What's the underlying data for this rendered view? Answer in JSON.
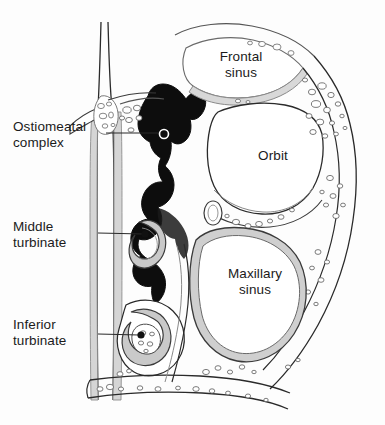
{
  "figure": {
    "background_color": "#fdfdfd",
    "width": 385,
    "height": 425
  },
  "palette": {
    "airspace_black": "#0d0d0d",
    "mucosa_gray": "#a8a8a8",
    "bone_gray": "#c9c9c9",
    "outline_dark": "#2a2a2a",
    "outline_light": "#555555",
    "marrow_fill": "#ffffff",
    "text_color": "#1b1b1b",
    "leader_color": "#2a2a2a"
  },
  "labels": {
    "ostiomeatal_complex": "Ostiomeatal\ncomplex",
    "middle_turbinate": "Middle\nturbinate",
    "inferior_turbinate": "Inferior\nturbinate",
    "frontal_sinus": "Frontal\nsinus",
    "orbit": "Orbit",
    "maxillary_sinus": "Maxillary\nsinus"
  },
  "leaders": [
    {
      "name": "ostiomeatal-complex",
      "from_x": 106,
      "from_y": 133,
      "to_x": 163,
      "to_y": 133,
      "marker": "open-circle",
      "marker_x": 164,
      "marker_y": 134,
      "marker_r": 4.5
    },
    {
      "name": "middle-turbinate",
      "from_x": 98,
      "from_y": 233,
      "to_x": 144,
      "to_y": 234,
      "marker": "filled-dot",
      "marker_x": 145,
      "marker_y": 234,
      "marker_r": 3.6
    },
    {
      "name": "inferior-turbinate",
      "from_x": 98,
      "from_y": 334,
      "to_x": 140,
      "to_y": 335,
      "marker": "filled-dot",
      "marker_x": 141,
      "marker_y": 335,
      "marker_r": 3.6
    }
  ],
  "structures": [
    {
      "name": "nasal-septum",
      "fill": "#ffffff",
      "stroke": "#2a2a2a"
    },
    {
      "name": "frontal-sinus",
      "fill": "#ffffff",
      "stroke": "#555555"
    },
    {
      "name": "orbit",
      "fill": "#ffffff",
      "stroke": "#2a2a2a"
    },
    {
      "name": "maxillary-sinus",
      "fill": "#ffffff",
      "stroke": "#2a2a2a"
    },
    {
      "name": "nasal-airspace",
      "fill": "#0d0d0d",
      "stroke": "#0d0d0d"
    },
    {
      "name": "middle-turbinate",
      "fill": "#c9c9c9",
      "stroke": "#3a3a3a"
    },
    {
      "name": "inferior-turbinate",
      "fill": "#c9c9c9",
      "stroke": "#3a3a3a"
    },
    {
      "name": "ethmoid-air-cells",
      "fill": "#ffffff",
      "stroke": "#5a5a5a"
    },
    {
      "name": "cancellous-bone",
      "fill": "#ffffff",
      "stroke": "#5a5a5a"
    },
    {
      "name": "hard-palate",
      "fill": "#ffffff",
      "stroke": "#2a2a2a"
    }
  ]
}
